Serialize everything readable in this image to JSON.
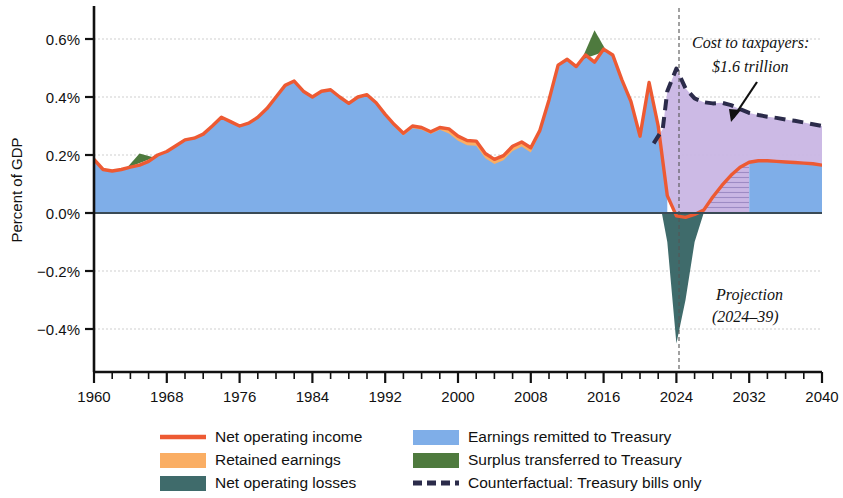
{
  "chart_data": {
    "type": "area",
    "title": "",
    "xlabel": "",
    "ylabel": "Percent of GDP",
    "xlim": [
      1960,
      2040
    ],
    "ylim": [
      -0.5,
      0.68
    ],
    "grid": true,
    "x_ticks": [
      1960,
      1968,
      1976,
      1984,
      1992,
      2000,
      2008,
      2016,
      2024,
      2032,
      2040
    ],
    "x_minor_tick_step": 2,
    "y_ticks": [
      -0.4,
      -0.2,
      0.0,
      0.2,
      0.4,
      0.6
    ],
    "y_tick_labels": [
      "−0.4%",
      "−0.2%",
      "0.0%",
      "0.2%",
      "0.4%",
      "0.6%"
    ],
    "projection_start": 2024,
    "legend_position": "bottom",
    "series": [
      {
        "name": "Net operating income",
        "kind": "line",
        "color": "#ED5A33",
        "x": [
          1960,
          1961,
          1962,
          1963,
          1964,
          1965,
          1966,
          1967,
          1968,
          1969,
          1970,
          1971,
          1972,
          1973,
          1974,
          1975,
          1976,
          1977,
          1978,
          1979,
          1980,
          1981,
          1982,
          1983,
          1984,
          1985,
          1986,
          1987,
          1988,
          1989,
          1990,
          1991,
          1992,
          1993,
          1994,
          1995,
          1996,
          1997,
          1998,
          1999,
          2000,
          2001,
          2002,
          2003,
          2004,
          2005,
          2006,
          2007,
          2008,
          2009,
          2010,
          2011,
          2012,
          2013,
          2014,
          2015,
          2016,
          2017,
          2018,
          2019,
          2020,
          2021,
          2022,
          2023,
          2024,
          2025,
          2026,
          2027,
          2028,
          2029,
          2030,
          2031,
          2032,
          2033,
          2034,
          2035,
          2036,
          2037,
          2038,
          2039,
          2040
        ],
        "y": [
          0.185,
          0.15,
          0.145,
          0.15,
          0.158,
          0.165,
          0.178,
          0.2,
          0.212,
          0.232,
          0.252,
          0.258,
          0.272,
          0.3,
          0.33,
          0.315,
          0.3,
          0.31,
          0.33,
          0.36,
          0.4,
          0.44,
          0.455,
          0.42,
          0.4,
          0.42,
          0.425,
          0.4,
          0.378,
          0.4,
          0.408,
          0.38,
          0.34,
          0.305,
          0.275,
          0.3,
          0.295,
          0.28,
          0.295,
          0.29,
          0.265,
          0.25,
          0.248,
          0.205,
          0.185,
          0.198,
          0.23,
          0.245,
          0.225,
          0.285,
          0.39,
          0.51,
          0.53,
          0.505,
          0.545,
          0.52,
          0.565,
          0.545,
          0.46,
          0.385,
          0.265,
          0.45,
          0.3,
          0.06,
          -0.01,
          -0.015,
          -0.005,
          0.01,
          0.055,
          0.095,
          0.13,
          0.158,
          0.175,
          0.18,
          0.18,
          0.178,
          0.176,
          0.174,
          0.172,
          0.17,
          0.165
        ]
      },
      {
        "name": "Earnings remitted to Treasury",
        "kind": "area",
        "color": "#7FAEE8",
        "note": "blue fill from zero to net operating income (historical) and to projected income after 2032"
      },
      {
        "name": "Retained earnings",
        "kind": "area",
        "color": "#FAAE64",
        "note": "thin orange band between remittances and net operating income, visible ~1993-2009"
      },
      {
        "name": "Net operating losses",
        "kind": "area",
        "color": "#3F6B6B",
        "note": "dark teal wedge below zero spanning 2022-2027, minimum -0.45% at 2024",
        "x": [
          2022.4,
          2023,
          2024,
          2025,
          2026,
          2027
        ],
        "y": [
          0.0,
          -0.1,
          -0.45,
          -0.3,
          -0.1,
          0.0
        ]
      },
      {
        "name": "Surplus transferred to Treasury",
        "kind": "area",
        "color": "#4E7A3E",
        "note": "green wedges above the remittance area in 1964-1966 and 2014-2016",
        "peaks": [
          {
            "x": 1965,
            "y": 0.205
          },
          {
            "x": 2015,
            "y": 0.63
          }
        ]
      },
      {
        "name": "Counterfactual: Treasury bills only",
        "kind": "dashed-line",
        "color": "#2B2B4A",
        "x": [
          2021.5,
          2022.5,
          2023,
          2024,
          2025,
          2026,
          2027,
          2028,
          2029,
          2030,
          2031,
          2032,
          2033,
          2034,
          2035,
          2036,
          2037,
          2038,
          2039,
          2040
        ],
        "y": [
          0.24,
          0.29,
          0.42,
          0.498,
          0.43,
          0.395,
          0.382,
          0.378,
          0.38,
          0.372,
          0.358,
          0.345,
          0.338,
          0.332,
          0.328,
          0.322,
          0.318,
          0.312,
          0.306,
          0.3
        ]
      },
      {
        "name": "Cost to taxpayers area",
        "kind": "area",
        "color": "#C9B6E4",
        "note": "lavender region between projected net operating income and the counterfactual line, 2022-2040"
      }
    ],
    "annotations": [
      {
        "id": "cost-callout",
        "text_lines": [
          "Cost to taxpayers:",
          "$1.6 trillion"
        ],
        "x": 2031,
        "y": 0.6,
        "arrow": true
      },
      {
        "id": "projection-note",
        "text_lines": [
          "Projection",
          "(2024–39)"
        ],
        "x": 2031,
        "y": -0.27,
        "arrow": false
      }
    ]
  },
  "legend": {
    "items": [
      {
        "label": "Net operating income",
        "swatch": "line",
        "color": "#ED5A33"
      },
      {
        "label": "Retained earnings",
        "swatch": "box",
        "color": "#FAAE64"
      },
      {
        "label": "Net operating losses",
        "swatch": "box",
        "color": "#3F6B6B"
      },
      {
        "label": "Earnings remitted to Treasury",
        "swatch": "box",
        "color": "#7FAEE8"
      },
      {
        "label": "Surplus transferred to Treasury",
        "swatch": "box",
        "color": "#4E7A3E"
      },
      {
        "label": "Counterfactual: Treasury bills only",
        "swatch": "dashed",
        "color": "#2B2B4A"
      }
    ]
  },
  "axis": {
    "y_title": "Percent of GDP",
    "y_labels": [
      "0.6%",
      "0.4%",
      "0.2%",
      "0.0%",
      "−0.2%",
      "−0.4%"
    ],
    "x_labels": [
      "1960",
      "1968",
      "1976",
      "1984",
      "1992",
      "2000",
      "2008",
      "2016",
      "2024",
      "2032",
      "2040"
    ]
  },
  "annotation_text": {
    "cost_line1": "Cost to taxpayers:",
    "cost_line2": "$1.6 trillion",
    "projection_line1": "Projection",
    "projection_line2": "(2024–39)"
  }
}
